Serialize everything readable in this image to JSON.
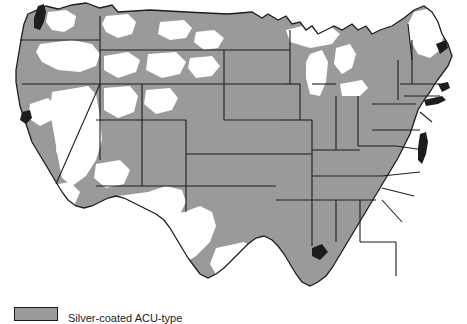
{
  "figure": {
    "type": "choropleth-map",
    "region": "contiguous-united-states",
    "background_color": "#ffffff",
    "shaded_color": "#9a9a9a",
    "unshaded_color": "#ffffff",
    "border_color": "#1d1d1d",
    "water_color": "#1d1d1d"
  },
  "legend": {
    "swatch_color": "#9a9a9a",
    "label": "Silver-coated ACU-type",
    "label_truncated": true
  },
  "map_data": {
    "type": "map",
    "value_scheme": "binary-coverage",
    "categories": [
      "covered",
      "not-covered"
    ],
    "states": [
      {
        "name": "Washington",
        "status": "covered",
        "partial_white": true
      },
      {
        "name": "Oregon",
        "status": "covered",
        "partial_white": true
      },
      {
        "name": "California",
        "status": "covered",
        "partial_white": true
      },
      {
        "name": "Nevada",
        "status": "not-covered",
        "partial_white": false
      },
      {
        "name": "Idaho",
        "status": "covered",
        "partial_white": true
      },
      {
        "name": "Montana",
        "status": "covered",
        "partial_white": true
      },
      {
        "name": "Wyoming",
        "status": "covered",
        "partial_white": true
      },
      {
        "name": "Utah",
        "status": "covered",
        "partial_white": true
      },
      {
        "name": "Colorado",
        "status": "covered",
        "partial_white": true
      },
      {
        "name": "Arizona",
        "status": "covered",
        "partial_white": true
      },
      {
        "name": "New Mexico",
        "status": "covered",
        "partial_white": true
      },
      {
        "name": "North Dakota",
        "status": "covered",
        "partial_white": false
      },
      {
        "name": "South Dakota",
        "status": "covered",
        "partial_white": false
      },
      {
        "name": "Nebraska",
        "status": "covered",
        "partial_white": false
      },
      {
        "name": "Kansas",
        "status": "covered",
        "partial_white": false
      },
      {
        "name": "Oklahoma",
        "status": "covered",
        "partial_white": false
      },
      {
        "name": "Texas",
        "status": "covered",
        "partial_white": true
      },
      {
        "name": "Minnesota",
        "status": "covered",
        "partial_white": false
      },
      {
        "name": "Iowa",
        "status": "covered",
        "partial_white": false
      },
      {
        "name": "Missouri",
        "status": "covered",
        "partial_white": false
      },
      {
        "name": "Arkansas",
        "status": "covered",
        "partial_white": false
      },
      {
        "name": "Louisiana",
        "status": "covered",
        "partial_white": false
      },
      {
        "name": "Wisconsin",
        "status": "covered",
        "partial_white": false
      },
      {
        "name": "Illinois",
        "status": "covered",
        "partial_white": false
      },
      {
        "name": "Michigan",
        "status": "covered",
        "partial_white": false
      },
      {
        "name": "Indiana",
        "status": "covered",
        "partial_white": false
      },
      {
        "name": "Ohio",
        "status": "covered",
        "partial_white": false
      },
      {
        "name": "Kentucky",
        "status": "covered",
        "partial_white": false
      },
      {
        "name": "Tennessee",
        "status": "covered",
        "partial_white": false
      },
      {
        "name": "Mississippi",
        "status": "covered",
        "partial_white": false
      },
      {
        "name": "Alabama",
        "status": "covered",
        "partial_white": false
      },
      {
        "name": "Georgia",
        "status": "covered",
        "partial_white": false
      },
      {
        "name": "Florida",
        "status": "covered",
        "partial_white": true
      },
      {
        "name": "South Carolina",
        "status": "covered",
        "partial_white": false
      },
      {
        "name": "North Carolina",
        "status": "covered",
        "partial_white": false
      },
      {
        "name": "Virginia",
        "status": "covered",
        "partial_white": false
      },
      {
        "name": "West Virginia",
        "status": "covered",
        "partial_white": false
      },
      {
        "name": "Maryland",
        "status": "covered",
        "partial_white": false
      },
      {
        "name": "Delaware",
        "status": "covered",
        "partial_white": false
      },
      {
        "name": "Pennsylvania",
        "status": "covered",
        "partial_white": false
      },
      {
        "name": "New Jersey",
        "status": "covered",
        "partial_white": false
      },
      {
        "name": "New York",
        "status": "covered",
        "partial_white": false
      },
      {
        "name": "Connecticut",
        "status": "covered",
        "partial_white": false
      },
      {
        "name": "Rhode Island",
        "status": "covered",
        "partial_white": false
      },
      {
        "name": "Massachusetts",
        "status": "covered",
        "partial_white": false
      },
      {
        "name": "Vermont",
        "status": "covered",
        "partial_white": false
      },
      {
        "name": "New Hampshire",
        "status": "covered",
        "partial_white": false
      },
      {
        "name": "Maine",
        "status": "not-covered",
        "partial_white": false
      }
    ]
  }
}
